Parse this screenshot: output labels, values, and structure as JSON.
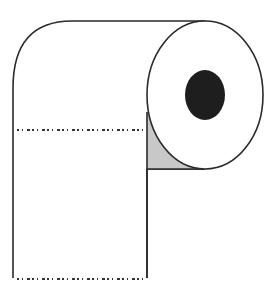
{
  "illustration": {
    "subject": "toilet paper roll",
    "colors": {
      "background": "#ffffff",
      "outline": "#2a2a2a",
      "core_hole": "#1e1e1e",
      "shadow": "#c8c8c8",
      "perforation": "#333333"
    }
  }
}
